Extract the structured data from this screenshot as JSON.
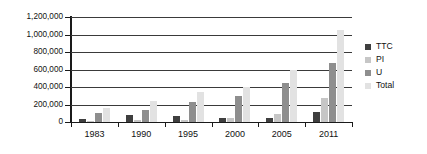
{
  "chart_data": {
    "type": "bar",
    "title": "",
    "subtitle": "",
    "xlabel": "",
    "ylabel": "",
    "categories": [
      "1983",
      "1990",
      "1995",
      "2000",
      "2005",
      "2011"
    ],
    "series": [
      {
        "name": "TTC",
        "color": "#3f3f3f",
        "values": [
          35000,
          80000,
          70000,
          50000,
          50000,
          110000
        ]
      },
      {
        "name": "PI",
        "color": "#c6c6c6",
        "values": [
          10000,
          25000,
          25000,
          45000,
          95000,
          270000
        ]
      },
      {
        "name": "U",
        "color": "#8e8e8e",
        "values": [
          105000,
          135000,
          230000,
          300000,
          450000,
          680000
        ]
      },
      {
        "name": "Total",
        "color": "#e2e2e2",
        "values": [
          155000,
          245000,
          340000,
          400000,
          600000,
          1050000
        ]
      }
    ],
    "ylim": [
      0,
      1200000
    ],
    "ytick_values": [
      0,
      200000,
      400000,
      600000,
      800000,
      1000000,
      1200000
    ],
    "ytick_labels": [
      "0",
      "200,000",
      "400,000",
      "600,000",
      "800,000",
      "1,000,000",
      "1,200,000"
    ],
    "grid": true,
    "grid_axis": "y",
    "legend_position": "right",
    "legend_entries": [
      "TTC",
      "PI",
      "U",
      "Total"
    ]
  },
  "axes": {
    "y_ticks": [
      {
        "label": "1,200,000",
        "value": 1200000
      },
      {
        "label": "1,000,000",
        "value": 1000000
      },
      {
        "label": "800,000",
        "value": 800000
      },
      {
        "label": "600,000",
        "value": 600000
      },
      {
        "label": "400,000",
        "value": 400000
      },
      {
        "label": "200,000",
        "value": 200000
      },
      {
        "label": "0",
        "value": 0
      }
    ],
    "x_ticks": [
      {
        "label": "1983"
      },
      {
        "label": "1990"
      },
      {
        "label": "1995"
      },
      {
        "label": "2000"
      },
      {
        "label": "2005"
      },
      {
        "label": "2011"
      }
    ]
  },
  "legend": {
    "items": [
      {
        "label": "TTC",
        "color": "#3f3f3f"
      },
      {
        "label": "PI",
        "color": "#c6c6c6"
      },
      {
        "label": "U",
        "color": "#8e8e8e"
      },
      {
        "label": "Total",
        "color": "#e2e2e2"
      }
    ]
  }
}
